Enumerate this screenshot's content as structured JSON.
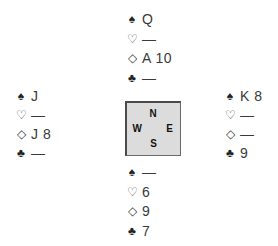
{
  "hands": {
    "north": {
      "spades": "Q",
      "hearts": "—",
      "diamonds": "A 10",
      "clubs": "—"
    },
    "west": {
      "spades": "J",
      "hearts": "—",
      "diamonds": "J 8",
      "clubs": "—"
    },
    "east": {
      "spades": "K 8",
      "hearts": "—",
      "diamonds": "—",
      "clubs": "9"
    },
    "south": {
      "spades": "—",
      "hearts": "6",
      "diamonds": "9",
      "clubs": "7"
    }
  },
  "suit_symbols": {
    "spades": "♠",
    "hearts": "♡",
    "diamonds": "◇",
    "clubs": "♣"
  },
  "compass": {
    "north": "N",
    "west": "W",
    "east": "E",
    "south": "S"
  }
}
